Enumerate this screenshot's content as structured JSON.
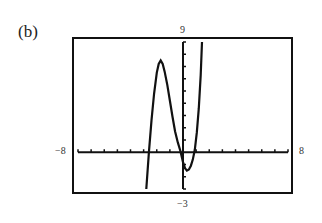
{
  "figure": {
    "label": "(b)",
    "xmin_label": "−8",
    "xmax_label": "8",
    "ymax_label": "9",
    "ymin_label": "−3"
  },
  "chart_data": {
    "type": "line",
    "title": "(b)",
    "xlabel": "",
    "ylabel": "",
    "xlim": [
      -8,
      8
    ],
    "ylim": [
      -3,
      9
    ],
    "xscale_tick": 1,
    "yscale_tick": 1,
    "grid": false,
    "legend": null,
    "series": [
      {
        "name": "graphing calculator cubic curve",
        "x": [
          -2.8,
          -2.6,
          -2.4,
          -2.2,
          -2.0,
          -1.85,
          -1.7,
          -1.55,
          -1.4,
          -1.2,
          -1.0,
          -0.8,
          -0.6,
          -0.4,
          -0.2,
          0.0,
          0.15,
          0.3,
          0.45,
          0.6,
          0.75,
          0.9,
          1.05,
          1.2,
          1.35,
          1.45
        ],
        "y": [
          -3.0,
          0.0,
          2.6,
          4.8,
          6.5,
          7.2,
          7.5,
          7.2,
          6.6,
          5.5,
          4.2,
          2.9,
          1.7,
          0.8,
          0.1,
          -0.8,
          -1.3,
          -1.5,
          -1.4,
          -1.1,
          -0.6,
          0.2,
          1.6,
          3.6,
          6.3,
          9.0
        ]
      }
    ],
    "annotations": [
      "−8",
      "8",
      "9",
      "−3"
    ]
  }
}
